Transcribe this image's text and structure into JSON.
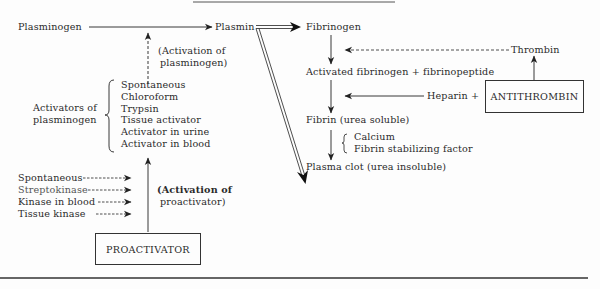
{
  "diagram": {
    "title_partial": "",
    "main_pathway": {
      "plasminogen": "Plasminogen",
      "plasmin": "Plasmin",
      "activation_label_line1": "(Activation of",
      "activation_label_line2": "plasminogen)"
    },
    "activators": {
      "group_label_line1": "Activators of",
      "group_label_line2": "plasminogen",
      "items": [
        "Spontaneous",
        "Chloroform",
        "Trypsin",
        "Tissue activator",
        "Activator in urine",
        "Activator in blood"
      ]
    },
    "proactivator": {
      "box_label": "PROACTIVATOR",
      "activation_label_line1": "(Activation of",
      "activation_label_line2": "proactivator)",
      "inputs": [
        "Spontaneous",
        "Streptokinase",
        "Kinase in blood",
        "Tissue kinase"
      ]
    },
    "clotting": {
      "fibrinogen": "Fibrinogen",
      "thrombin": "Thrombin",
      "activated": "Activated fibrinogen + fibrinopeptide",
      "heparin": "Heparin +",
      "antithrombin_box": "ANTITHROMBIN",
      "fibrin": "Fibrin (urea soluble)",
      "cofactors": [
        "Calcium",
        "Fibrin stabilizing factor"
      ],
      "plasma_clot": "Plasma clot (urea insoluble)"
    },
    "colors": {
      "ink": "#2a2a2a",
      "background": "#fdfdfd"
    }
  }
}
